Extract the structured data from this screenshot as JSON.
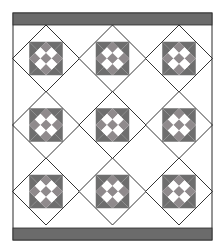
{
  "quilt": {
    "title": "",
    "width": 224,
    "height": 252,
    "frame": {
      "x": 13,
      "y": 13,
      "w": 199,
      "h": 227
    },
    "border_top": {
      "x": 13,
      "y": 13,
      "w": 199,
      "h": 12
    },
    "border_bottom": {
      "x": 13,
      "y": 228,
      "w": 199,
      "h": 12
    },
    "field": {
      "x": 13,
      "y": 25,
      "w": 199,
      "h": 203
    },
    "rows": 3,
    "cols": 3,
    "block_centers_x": [
      46,
      112.5,
      179
    ],
    "block_centers_y": [
      58.5,
      125,
      191.5
    ],
    "block_half_diagonal": 33.5,
    "colors": {
      "background": "#ffffff",
      "border": "#6b6b6b",
      "star_dark": "#6e6e6e",
      "nine_patch": "#8f8a8c",
      "light": "#ffffff",
      "line": "#2a2a2a"
    }
  }
}
